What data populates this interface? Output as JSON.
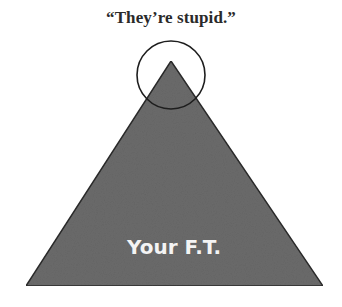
{
  "diagram": {
    "title_quote": "“They’re stupid.”",
    "pyramid_label": "Your F.T.",
    "colors": {
      "pyramid_fill": "#6b6b6b",
      "pyramid_stroke": "#2b2b2b",
      "circle_stroke": "#1e1e1e",
      "label_text": "#f4f4f4",
      "quote_text": "#2a2a2a"
    },
    "shapes": {
      "triangle": {
        "apex": [
          171,
          61
        ],
        "base_left": [
          26,
          286
        ],
        "base_right": [
          323,
          286
        ]
      },
      "circle": {
        "center": [
          171,
          75
        ],
        "radius": 34
      }
    }
  }
}
